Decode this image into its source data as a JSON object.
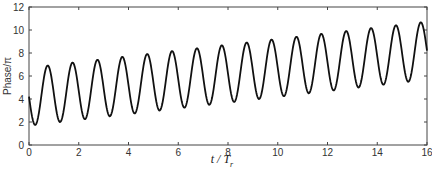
{
  "chart_data": {
    "type": "line",
    "title": "",
    "xlabel": "t / T_r",
    "xlabel_main": "t / T",
    "xlabel_sub": "r",
    "ylabel": "Phase/π",
    "xlim": [
      0,
      16
    ],
    "ylim": [
      0,
      12
    ],
    "xticks": [
      0,
      2,
      4,
      6,
      8,
      10,
      12,
      14,
      16
    ],
    "yticks": [
      0,
      2,
      4,
      6,
      8,
      10,
      12
    ],
    "grid": false,
    "legend": null,
    "series": [
      {
        "name": "Phase",
        "description": "Oscillation with period 1 (in t/T_r), amplitude ~2.5, on a linearly rising baseline (~0.25 per unit)",
        "peaks": [
          {
            "t": 0.75,
            "y": 6.85
          },
          {
            "t": 1.75,
            "y": 7.1
          },
          {
            "t": 2.75,
            "y": 7.35
          },
          {
            "t": 3.75,
            "y": 7.6
          },
          {
            "t": 4.75,
            "y": 7.85
          },
          {
            "t": 5.75,
            "y": 8.1
          },
          {
            "t": 6.75,
            "y": 8.35
          },
          {
            "t": 7.75,
            "y": 8.6
          },
          {
            "t": 8.75,
            "y": 8.85
          },
          {
            "t": 9.75,
            "y": 9.1
          },
          {
            "t": 10.75,
            "y": 9.35
          },
          {
            "t": 11.75,
            "y": 9.6
          },
          {
            "t": 12.75,
            "y": 9.85
          },
          {
            "t": 13.75,
            "y": 10.1
          },
          {
            "t": 14.75,
            "y": 10.4
          },
          {
            "t": 15.75,
            "y": 10.7
          }
        ],
        "troughs": [
          {
            "t": 0.25,
            "y": 1.8
          },
          {
            "t": 1.25,
            "y": 2.05
          },
          {
            "t": 2.25,
            "y": 2.3
          },
          {
            "t": 3.25,
            "y": 2.55
          },
          {
            "t": 4.25,
            "y": 2.8
          },
          {
            "t": 5.25,
            "y": 3.05
          },
          {
            "t": 6.25,
            "y": 3.3
          },
          {
            "t": 7.25,
            "y": 3.55
          },
          {
            "t": 8.25,
            "y": 3.8
          },
          {
            "t": 9.25,
            "y": 4.05
          },
          {
            "t": 10.25,
            "y": 4.3
          },
          {
            "t": 11.25,
            "y": 4.55
          },
          {
            "t": 12.25,
            "y": 4.8
          },
          {
            "t": 13.25,
            "y": 5.05
          },
          {
            "t": 14.25,
            "y": 5.3
          },
          {
            "t": 15.25,
            "y": 5.6
          }
        ],
        "start": {
          "t": 0,
          "y": 4.0
        },
        "end": {
          "t": 16,
          "y": 8.1
        },
        "model": {
          "baseline_at_0_5": 4.33,
          "slope": 0.25,
          "amplitude": 2.52,
          "period": 1.0,
          "first_trough_t": 0.25
        },
        "color": "#111111"
      }
    ]
  }
}
